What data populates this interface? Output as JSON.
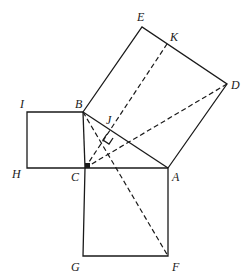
{
  "diagram": {
    "type": "geometry",
    "points": {
      "A": {
        "label": "A",
        "x": 168,
        "y": 168
      },
      "B": {
        "label": "B",
        "x": 83,
        "y": 112
      },
      "C": {
        "label": "C",
        "x": 85,
        "y": 168
      },
      "D": {
        "label": "D",
        "x": 227,
        "y": 84
      },
      "E": {
        "label": "E",
        "x": 142,
        "y": 27
      },
      "F": {
        "label": "F",
        "x": 168,
        "y": 256
      },
      "G": {
        "label": "G",
        "x": 83,
        "y": 256
      },
      "H": {
        "label": "H",
        "x": 27,
        "y": 168
      },
      "I": {
        "label": "I",
        "x": 27,
        "y": 112
      },
      "J": {
        "label": "J",
        "x": 110,
        "y": 129
      },
      "K": {
        "label": "K",
        "x": 167,
        "y": 44
      }
    },
    "labels": {
      "A": "A",
      "B": "B",
      "C": "C",
      "D": "D",
      "E": "E",
      "F": "F",
      "G": "G",
      "H": "H",
      "I": "I",
      "J": "J",
      "K": "K"
    },
    "squares": [
      "BCHI",
      "ACGF",
      "ABED"
    ],
    "solid_segments": [
      "AB",
      "BC",
      "CA",
      "BE",
      "ED",
      "DA",
      "BI",
      "IH",
      "HC",
      "CG",
      "GF",
      "FA"
    ],
    "dashed_segments": [
      "CK",
      "CD",
      "BF"
    ],
    "markers": [
      "right-angle at J",
      "right-angle at C"
    ]
  }
}
